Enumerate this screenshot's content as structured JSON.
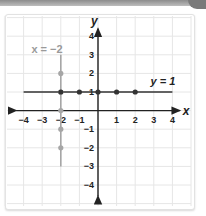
{
  "colors": {
    "axis": "#222222",
    "grid": "#e6e6e6",
    "horizontal_line": "#333333",
    "vertical_line": "#a6a6a6",
    "label_dark": "#222222",
    "label_gray": "#9a9a9a"
  },
  "labels": {
    "x_axis": "x",
    "y_axis": "y",
    "line_h": "y = 1",
    "line_v": "x = −2"
  },
  "ticks": {
    "x": [
      "−4",
      "−3",
      "−2",
      "−1",
      "1",
      "2",
      "3",
      "4"
    ],
    "y": [
      "4",
      "3",
      "2",
      "1",
      "−1",
      "−2",
      "−3",
      "−4"
    ]
  },
  "chart_data": {
    "type": "line",
    "title": "",
    "xlabel": "x",
    "ylabel": "y",
    "xlim": [
      -4,
      4
    ],
    "ylim": [
      -4,
      4
    ],
    "grid": true,
    "legend": "none",
    "x_ticks": [
      -4,
      -3,
      -2,
      -1,
      1,
      2,
      3,
      4
    ],
    "y_ticks": [
      -4,
      -3,
      -2,
      -1,
      1,
      2,
      3,
      4
    ],
    "series": [
      {
        "name": "y = 1",
        "color": "#333333",
        "line": {
          "from": [
            -4,
            1
          ],
          "to": [
            4,
            1
          ]
        },
        "points": [
          [
            -2,
            1
          ],
          [
            -1,
            1
          ],
          [
            0,
            1
          ],
          [
            1,
            1
          ],
          [
            2,
            1
          ]
        ]
      },
      {
        "name": "x = −2",
        "color": "#a6a6a6",
        "line": {
          "from": [
            -2,
            3
          ],
          "to": [
            -2,
            -3
          ]
        },
        "points": [
          [
            -2,
            2
          ],
          [
            -2,
            1
          ],
          [
            -2,
            0
          ],
          [
            -2,
            -1
          ],
          [
            -2,
            -2
          ]
        ]
      }
    ],
    "annotations": [
      {
        "text": "y = 1",
        "at": [
          3.3,
          1.6
        ]
      },
      {
        "text": "x = −2",
        "at": [
          -3.2,
          3.3
        ]
      }
    ]
  }
}
